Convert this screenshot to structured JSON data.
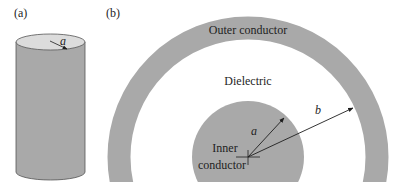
{
  "panel_a": {
    "label": "(a)",
    "radius_label": "a"
  },
  "panel_b": {
    "label": "(b)",
    "outer_conductor_label": "Outer conductor",
    "dielectric_label": "Dielectric",
    "inner_conductor_label_line1": "Inner",
    "inner_conductor_label_line2": "conductor",
    "inner_radius_label": "a",
    "outer_radius_label": "b"
  },
  "colors": {
    "conductor_fill": "#a9a9a9",
    "cylinder_top": "#dcdcdc",
    "dielectric": "#ffffff",
    "line": "#1e1e1e"
  }
}
